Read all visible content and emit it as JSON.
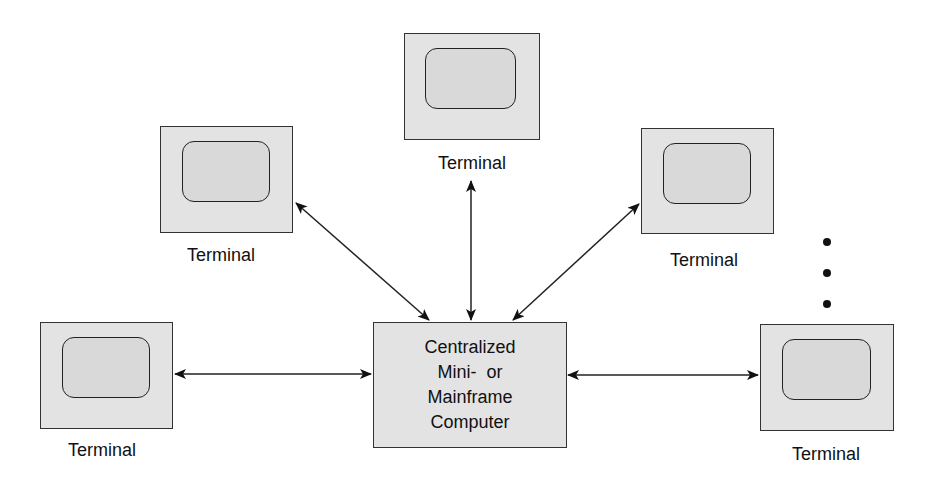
{
  "diagram": {
    "type": "star-topology",
    "central": {
      "lines": [
        "Centralized",
        "Mini-  or",
        "Mainframe",
        "Computer"
      ]
    },
    "terminals": [
      {
        "id": "top",
        "label": "Terminal"
      },
      {
        "id": "upper-left",
        "label": "Terminal"
      },
      {
        "id": "upper-right",
        "label": "Terminal"
      },
      {
        "id": "lower-left",
        "label": "Terminal"
      },
      {
        "id": "lower-right",
        "label": "Terminal"
      }
    ],
    "continuation": "ellipsis (three vertical dots) indicating more terminals",
    "connections": [
      {
        "from": "central",
        "to": "top",
        "bidirectional": true
      },
      {
        "from": "central",
        "to": "upper-left",
        "bidirectional": true
      },
      {
        "from": "central",
        "to": "upper-right",
        "bidirectional": true
      },
      {
        "from": "central",
        "to": "lower-left",
        "bidirectional": true
      },
      {
        "from": "central",
        "to": "lower-right",
        "bidirectional": true
      }
    ]
  },
  "colors": {
    "box_fill": "#e3e3e3",
    "screen_fill": "#d9d9d9",
    "stroke": "#222222"
  }
}
